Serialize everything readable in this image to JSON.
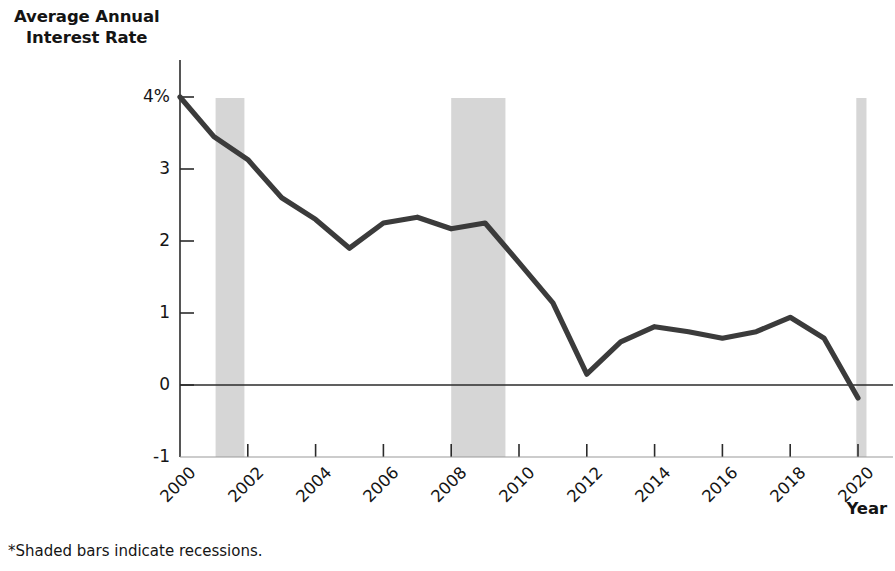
{
  "figure": {
    "y_axis_title_line1": "Average Annual",
    "y_axis_title_line2": "Interest Rate",
    "x_axis_title": "Year",
    "footnote": "*Shaded bars indicate recessions.",
    "line_color": "#3b3b3b",
    "recession_band_color": "#d6d6d6",
    "axis_color": "#2b2b2b",
    "background_color": "#ffffff"
  },
  "chart_data": {
    "type": "line",
    "title": "",
    "xlabel": "Year",
    "ylabel": "Average Annual Interest Rate",
    "ylim": [
      -1,
      4
    ],
    "xlim": [
      2000,
      2020
    ],
    "grid": false,
    "legend": "none",
    "y_ticks": [
      -1,
      0,
      1,
      2,
      3,
      4
    ],
    "y_tick_labels": [
      "-1",
      "0",
      "1",
      "2",
      "3",
      "4%"
    ],
    "x_ticks": [
      2000,
      2002,
      2004,
      2006,
      2008,
      2010,
      2012,
      2014,
      2016,
      2018,
      2020
    ],
    "x_tick_labels": [
      "2000",
      "2002",
      "2004",
      "2006",
      "2008",
      "2010",
      "2012",
      "2014",
      "2016",
      "2018",
      "2020"
    ],
    "x": [
      2000,
      2001,
      2002,
      2003,
      2004,
      2005,
      2006,
      2007,
      2008,
      2009,
      2010,
      2011,
      2012,
      2013,
      2014,
      2015,
      2016,
      2017,
      2018,
      2019,
      2020
    ],
    "values": [
      4.0,
      3.45,
      3.13,
      2.6,
      2.3,
      1.9,
      2.25,
      2.33,
      2.17,
      2.25,
      1.7,
      1.14,
      0.15,
      0.6,
      0.81,
      0.74,
      0.65,
      0.74,
      0.94,
      0.65,
      -0.18
    ],
    "series": [
      {
        "name": "Average Annual Interest Rate",
        "values": [
          4.0,
          3.45,
          3.13,
          2.6,
          2.3,
          1.9,
          2.25,
          2.33,
          2.17,
          2.25,
          1.7,
          1.14,
          0.15,
          0.6,
          0.81,
          0.74,
          0.65,
          0.74,
          0.94,
          0.65,
          -0.18
        ]
      }
    ],
    "annotations": [
      {
        "type": "recession_band",
        "start": 2001.05,
        "end": 2001.9
      },
      {
        "type": "recession_band",
        "start": 2008.0,
        "end": 2009.6
      },
      {
        "type": "recession_band",
        "start": 2019.95,
        "end": 2020.25
      }
    ],
    "zero_line": 0
  }
}
